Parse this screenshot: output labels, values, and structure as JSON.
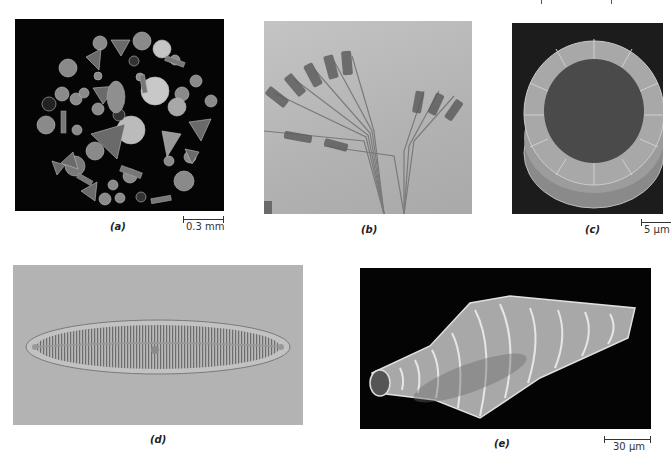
{
  "figure": {
    "panels": [
      {
        "id": "a",
        "label": "(a)",
        "scale_bar": "0.3 mm",
        "description": "Assorted diatoms arranged in a circle, dark field"
      },
      {
        "id": "b",
        "label": "(b)",
        "scale_bar": "",
        "description": "Fan-shaped colonial diatoms, light micrograph"
      },
      {
        "id": "c",
        "label": "(c)",
        "scale_bar": "5 μm",
        "description": "Centric diatom frustule, SEM"
      },
      {
        "id": "d",
        "label": "(d)",
        "scale_bar": "",
        "description": "Pennate diatom with striae, light micrograph"
      },
      {
        "id": "e",
        "label": "(e)",
        "scale_bar": "30 μm",
        "description": "Diatom frustule with ribs, SEM"
      }
    ]
  },
  "colors": {
    "background": "#ffffff",
    "panel_a_bg": "#050505",
    "panel_b_bg": "#b9b9b9",
    "panel_c_bg": "#1c1c1c",
    "panel_d_bg": "#b3b3b3",
    "panel_e_bg": "#040404"
  }
}
